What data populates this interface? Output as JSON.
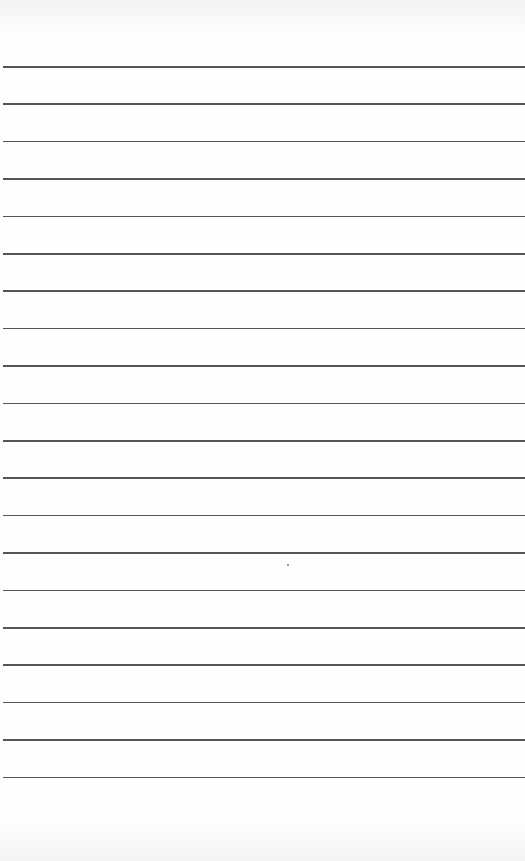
{
  "page": {
    "type": "lined-paper",
    "background_color": "#fdfdfd",
    "line_color": "#555555",
    "line_count": 20,
    "first_line_y": 66,
    "line_spacing": 37.4,
    "text": ""
  }
}
